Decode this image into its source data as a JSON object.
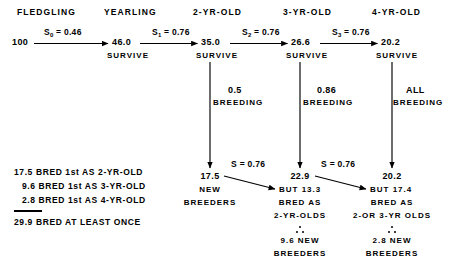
{
  "diagram": {
    "title_row": {
      "headers": [
        {
          "label": "FLEDGLING"
        },
        {
          "label": "YEARLING"
        },
        {
          "label": "2-YR-OLD"
        },
        {
          "label": "3-YR-OLD"
        },
        {
          "label": "4-YR-OLD"
        }
      ]
    },
    "survival_chain": {
      "start_value": "100",
      "steps": [
        {
          "rate_symbol": "S",
          "rate_sub": "0",
          "rate_eq": "= 0.46",
          "result": "46.0",
          "result_caption": "SURVIVE"
        },
        {
          "rate_symbol": "S",
          "rate_sub": "1",
          "rate_eq": "= 0.76",
          "result": "35.0",
          "result_caption": "SURVIVE"
        },
        {
          "rate_symbol": "S",
          "rate_sub": "2",
          "rate_eq": "= 0.76",
          "result": "26.6",
          "result_caption": "SURVIVE"
        },
        {
          "rate_symbol": "S",
          "rate_sub": "3",
          "rate_eq": "= 0.76",
          "result": "20.2",
          "result_caption": "SURVIVE"
        }
      ]
    },
    "breeding_branches": [
      {
        "fraction": "0.5",
        "label": "BREEDING"
      },
      {
        "fraction": "0.86",
        "label": "BREEDING"
      },
      {
        "fraction": "ALL",
        "label": "BREEDING"
      }
    ],
    "breeder_columns": [
      {
        "value": "17.5",
        "line2": "NEW",
        "line3": "BREEDERS",
        "line4": "",
        "line5": "",
        "therefore_value": "",
        "therefore_label": ""
      },
      {
        "value": "22.9",
        "line2": "BUT 13.3",
        "line3": "BRED AS",
        "line4": "2-YR-OLDS",
        "therefore_value": "9.6 NEW",
        "therefore_label": "BREEDERS"
      },
      {
        "value": "20.2",
        "line2": "BUT 17.4",
        "line3": "BRED AS",
        "line4": "2-OR 3-YR OLDS",
        "therefore_value": "2.8 NEW",
        "therefore_label": "BREEDERS"
      }
    ],
    "transfer_rates": [
      {
        "text": "S  = 0.76"
      },
      {
        "text": "S  = 0.76"
      }
    ],
    "summary": {
      "rows": [
        "17.5 BRED 1st AS 2-YR-OLD",
        "9.6 BRED 1st AS 3-YR-OLD",
        "2.8 BRED 1st AS 4-YR-OLD"
      ],
      "total": "29.9 BRED AT LEAST ONCE"
    },
    "colors": {
      "ink": "#000000",
      "background": "#ffffff"
    }
  }
}
